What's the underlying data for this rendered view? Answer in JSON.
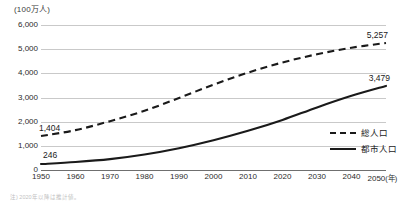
{
  "chart_data": {
    "type": "line",
    "title": "",
    "unit_label": "(100万人)",
    "xlabel": "(年)",
    "ylabel": "",
    "x": [
      1950,
      1960,
      1970,
      1980,
      1990,
      2000,
      2010,
      2020,
      2030,
      2040,
      2050
    ],
    "xtick_labels": [
      "1950",
      "1960",
      "1970",
      "1980",
      "1990",
      "2000",
      "2010",
      "2020",
      "2030",
      "2040",
      "2050"
    ],
    "xlim": [
      1950,
      2050
    ],
    "ylim": [
      0,
      6000
    ],
    "ytick_labels": [
      "0",
      "1,000",
      "2,000",
      "3,000",
      "4,000",
      "5,000",
      "6,000"
    ],
    "ytick_values": [
      0,
      1000,
      2000,
      3000,
      4000,
      5000,
      6000
    ],
    "grid": true,
    "legend_position": "right",
    "series": [
      {
        "name": "総人口",
        "style": "dashed",
        "color": "#1a1a1a",
        "values": [
          1404,
          1650,
          2020,
          2450,
          2980,
          3530,
          4030,
          4450,
          4790,
          5060,
          5257
        ],
        "start_label": "1,404",
        "end_label": "5,257"
      },
      {
        "name": "都市人口",
        "style": "solid",
        "color": "#1a1a1a",
        "values": [
          246,
          330,
          450,
          640,
          900,
          1230,
          1620,
          2070,
          2590,
          3070,
          3479
        ],
        "start_label": "246",
        "end_label": "3,479"
      }
    ],
    "annotations": [
      {
        "text": "1,404",
        "series": "総人口",
        "at_x": 1950
      },
      {
        "text": "5,257",
        "series": "総人口",
        "at_x": 2050
      },
      {
        "text": "246",
        "series": "都市人口",
        "at_x": 1950
      },
      {
        "text": "3,479",
        "series": "都市人口",
        "at_x": 2050
      }
    ]
  },
  "legend": {
    "items": [
      {
        "label": "総人口",
        "style": "dashed"
      },
      {
        "label": "都市人口",
        "style": "solid"
      }
    ]
  },
  "footnote": {
    "text": "注) 2020年以降は推計値。"
  }
}
